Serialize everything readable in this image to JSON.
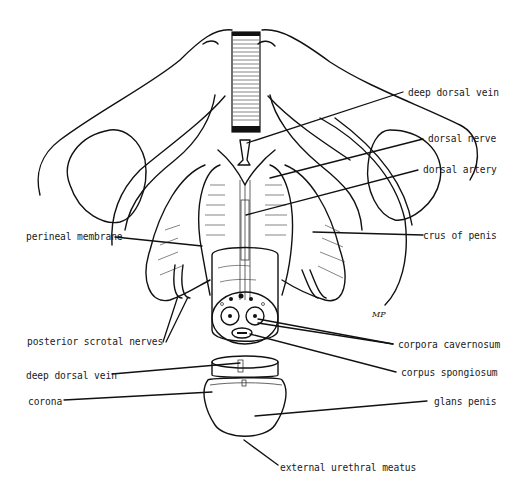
{
  "figure": {
    "signature": "MP"
  },
  "labels": {
    "right": {
      "deep_dorsal_vein": "deep dorsal vein",
      "dorsal_nerve": "dorsal nerve",
      "dorsal_artery": "dorsal artery",
      "crus_of_penis": "crus of penis",
      "corpora_cavernosum": "corpora cavernosum",
      "corpus_spongiosum": "corpus spongiosum",
      "glans_penis": "glans penis"
    },
    "left": {
      "perineal_membrane": "perineal membrane",
      "posterior_scrotal_nerves": "posterior scrotal nerves",
      "deep_dorsal_vein": "deep dorsal vein",
      "corona": "corona"
    },
    "bottom": {
      "external_urethral_meatus": "external urethral meatus"
    }
  },
  "colors": {
    "ink": "#111111",
    "background": "#ffffff"
  }
}
